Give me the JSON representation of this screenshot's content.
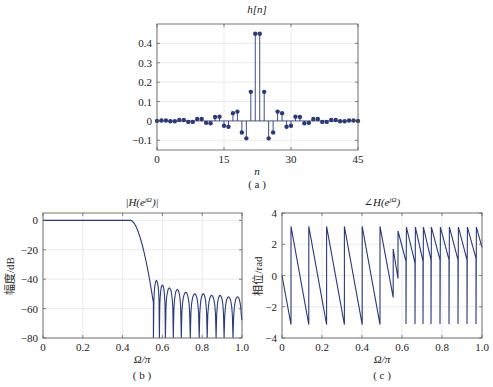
{
  "chart_data": [
    {
      "id": "a",
      "type": "stem",
      "title": "h[n]",
      "xlabel": "n",
      "ylabel": "",
      "caption": "( a )",
      "xlim": [
        0,
        45
      ],
      "ylim": [
        -0.15,
        0.5
      ],
      "xticks": [
        0,
        15,
        30,
        45
      ],
      "yticks": [
        -0.1,
        0,
        0.1,
        0.2,
        0.3,
        0.4
      ],
      "ytick_labels": [
        "−0.1",
        "0",
        "0.1",
        "0.2",
        "0.3",
        "0.4"
      ],
      "grid": true,
      "color": "#2b3a7a",
      "x": [
        0,
        1,
        2,
        3,
        4,
        5,
        6,
        7,
        8,
        9,
        10,
        11,
        12,
        13,
        14,
        15,
        16,
        17,
        18,
        19,
        20,
        21,
        22,
        23,
        24,
        25,
        26,
        27,
        28,
        29,
        30,
        31,
        32,
        33,
        34,
        35,
        36,
        37,
        38,
        39,
        40,
        41,
        42,
        43,
        44,
        45
      ],
      "values": [
        0,
        0.002,
        0.002,
        -0.002,
        -0.002,
        0.005,
        0.005,
        -0.005,
        -0.005,
        0.01,
        0.01,
        -0.01,
        -0.012,
        0.02,
        0.022,
        -0.025,
        -0.03,
        0.04,
        0.048,
        -0.06,
        -0.09,
        0.15,
        0.45,
        0.45,
        0.15,
        -0.09,
        -0.06,
        0.048,
        0.04,
        -0.03,
        -0.025,
        0.022,
        0.02,
        -0.012,
        -0.01,
        0.01,
        0.01,
        -0.005,
        -0.005,
        0.005,
        0.005,
        -0.002,
        -0.002,
        0.002,
        0.002,
        0
      ]
    },
    {
      "id": "b",
      "type": "line",
      "title": "|H(e^{jΩ})|",
      "title_display": "|H(e",
      "title_sup": "jΩ",
      "title_tail": ")|",
      "xlabel": "Ω/π",
      "ylabel": "幅度/dB",
      "caption": "( b )",
      "xlim": [
        0,
        1.0
      ],
      "ylim": [
        -80,
        5
      ],
      "xticks": [
        0,
        0.2,
        0.4,
        0.6,
        0.8,
        1.0
      ],
      "xtick_labels": [
        "0",
        "0.2",
        "0.4",
        "0.6",
        "0.8",
        "1.0"
      ],
      "yticks": [
        -80,
        -60,
        -40,
        -20,
        0
      ],
      "ytick_labels": [
        "−80",
        "−60",
        "−40",
        "−20",
        "0"
      ],
      "grid": true,
      "color": "#2b3a7a",
      "passband": {
        "x": [
          0,
          0.45
        ],
        "y": 0
      },
      "transition": {
        "x": [
          0.45,
          0.555
        ],
        "y": [
          0,
          -56
        ]
      },
      "sidelobe_peaks_db": [
        -41,
        -44,
        -46,
        -47,
        -49,
        -50,
        -50,
        -51,
        -51,
        -52,
        -52,
        -52
      ],
      "nulls_x": [
        0.555,
        0.585,
        0.615,
        0.655,
        0.695,
        0.74,
        0.785,
        0.825,
        0.87,
        0.91,
        0.955,
        1.0
      ]
    },
    {
      "id": "c",
      "type": "line",
      "title": "∠H(e^{jΩ})",
      "title_display": "∠H(e",
      "title_sup": "jΩ",
      "title_tail": ")",
      "xlabel": "Ω/π",
      "ylabel": "相位/rad",
      "caption": "( c )",
      "xlim": [
        0,
        1.0
      ],
      "ylim": [
        -4,
        4
      ],
      "xticks": [
        0,
        0.2,
        0.4,
        0.6,
        0.8,
        1.0
      ],
      "xtick_labels": [
        "0",
        "0.2",
        "0.4",
        "0.6",
        "0.8",
        "1.0"
      ],
      "yticks": [
        -4,
        -2,
        0,
        2,
        4
      ],
      "ytick_labels": [
        "−4",
        "−2",
        "0",
        "2",
        "4"
      ],
      "grid": true,
      "color": "#2b3a7a",
      "points": [
        [
          0,
          0
        ],
        [
          0.045,
          -3.14
        ],
        [
          0.045,
          3.14
        ],
        [
          0.134,
          -3.14
        ],
        [
          0.134,
          3.14
        ],
        [
          0.223,
          -3.14
        ],
        [
          0.223,
          3.14
        ],
        [
          0.312,
          -3.14
        ],
        [
          0.312,
          3.14
        ],
        [
          0.401,
          -3.14
        ],
        [
          0.401,
          3.14
        ],
        [
          0.49,
          -3.14
        ],
        [
          0.49,
          3.14
        ],
        [
          0.556,
          -1.4
        ],
        [
          0.556,
          1.7
        ],
        [
          0.58,
          -0.2
        ],
        [
          0.58,
          2.85
        ],
        [
          0.62,
          0.9
        ],
        [
          0.62,
          -3.1
        ],
        [
          0.622,
          3.1
        ],
        [
          0.665,
          0.8
        ],
        [
          0.665,
          -3.1
        ],
        [
          0.667,
          3.1
        ],
        [
          0.705,
          0.9
        ],
        [
          0.705,
          -3.1
        ],
        [
          0.707,
          3.1
        ],
        [
          0.745,
          1.0
        ],
        [
          0.745,
          -3.1
        ],
        [
          0.747,
          3.1
        ],
        [
          0.79,
          1.0
        ],
        [
          0.79,
          -2.2
        ],
        [
          0.79,
          -3.1
        ],
        [
          0.792,
          3.1
        ],
        [
          0.835,
          1.0
        ],
        [
          0.835,
          -2.2
        ],
        [
          0.835,
          -3.1
        ],
        [
          0.837,
          3.1
        ],
        [
          0.88,
          1.0
        ],
        [
          0.88,
          -2.0
        ],
        [
          0.88,
          -3.1
        ],
        [
          0.882,
          3.1
        ],
        [
          0.925,
          1.0
        ],
        [
          0.925,
          -2.0
        ],
        [
          0.925,
          -3.1
        ],
        [
          0.927,
          3.1
        ],
        [
          0.97,
          1.1
        ],
        [
          0.97,
          -2.0
        ],
        [
          0.97,
          -3.1
        ],
        [
          0.972,
          3.1
        ],
        [
          1.0,
          1.8
        ]
      ]
    }
  ]
}
